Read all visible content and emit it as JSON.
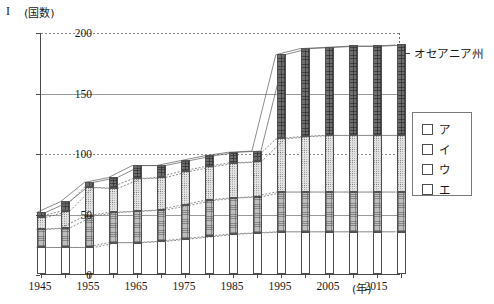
{
  "figure": {
    "number_label": "I",
    "unit_label": "(国数)"
  },
  "annotation": {
    "text": "オセアニア州",
    "target_series": "ア"
  },
  "legend": {
    "items": [
      {
        "label": "ア",
        "pattern": "dark-crosshatch"
      },
      {
        "label": "イ",
        "pattern": "light-dotted"
      },
      {
        "label": "ウ",
        "pattern": "medium-checker"
      },
      {
        "label": "エ",
        "pattern": "white"
      }
    ]
  },
  "chart_data": {
    "type": "bar",
    "title": "",
    "subtitle": "",
    "xlabel": "(年)",
    "ylabel": "(国数)",
    "stacked": true,
    "grid": true,
    "legend_position": "right",
    "ylim": [
      0,
      200
    ],
    "yticks": [
      0,
      50,
      100,
      150,
      200
    ],
    "xlim": [
      1945,
      2020
    ],
    "categories": [
      1945,
      1950,
      1955,
      1960,
      1965,
      1970,
      1975,
      1980,
      1985,
      1990,
      1995,
      2000,
      2005,
      2010,
      2015,
      2020
    ],
    "xtick_labels": [
      "1945",
      "1955",
      "1965",
      "1975",
      "1985",
      "1995",
      "2005",
      "2015"
    ],
    "xtick_values": [
      1945,
      1955,
      1965,
      1975,
      1985,
      1995,
      2005,
      2015
    ],
    "series": [
      {
        "name": "エ",
        "pattern": "white",
        "values": [
          22,
          22,
          22,
          26,
          26,
          27,
          29,
          31,
          33,
          34,
          35,
          35,
          35,
          35,
          35,
          35
        ]
      },
      {
        "name": "ウ",
        "pattern": "medium-checker",
        "values": [
          15,
          16,
          26,
          25,
          26,
          26,
          28,
          30,
          30,
          30,
          33,
          33,
          33,
          33,
          33,
          33
        ]
      },
      {
        "name": "イ",
        "pattern": "light-dotted",
        "values": [
          10,
          14,
          24,
          20,
          27,
          27,
          28,
          28,
          29,
          29,
          44,
          46,
          47,
          47,
          47,
          47
        ]
      },
      {
        "name": "ア",
        "pattern": "dark-crosshatch",
        "values": [
          4,
          8,
          4,
          9,
          11,
          10,
          9,
          9,
          9,
          9,
          70,
          73,
          73,
          74,
          74,
          75
        ]
      }
    ],
    "totals": [
      51,
      60,
      76,
      80,
      90,
      90,
      94,
      98,
      101,
      102,
      182,
      187,
      188,
      189,
      189,
      190
    ]
  }
}
